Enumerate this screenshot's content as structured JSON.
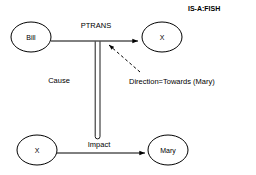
{
  "diagram": {
    "corner_annotation": "IS-A:FISH",
    "nodes": [
      {
        "id": "bill",
        "label": "Bill",
        "cx": 31,
        "cy": 37,
        "rx": 20,
        "ry": 15
      },
      {
        "id": "x_top",
        "label": "X",
        "cx": 162,
        "cy": 37,
        "rx": 20,
        "ry": 15
      },
      {
        "id": "x_bot",
        "label": "X",
        "cx": 37,
        "cy": 150,
        "rx": 20,
        "ry": 15
      },
      {
        "id": "mary",
        "label": "Mary",
        "cx": 168,
        "cy": 150,
        "rx": 20,
        "ry": 15
      }
    ],
    "edges": [
      {
        "id": "ptrans",
        "label": "PTRANS",
        "from": "bill",
        "to": "x_top",
        "style": "solid-arrow"
      },
      {
        "id": "impact",
        "label": "Impact",
        "from": "x_bot",
        "to": "mary",
        "style": "solid-arrow"
      },
      {
        "id": "cause",
        "label": "Cause",
        "from": "impact",
        "to": "ptrans",
        "style": "double-line"
      }
    ],
    "annotations": [
      {
        "id": "direction",
        "text": "Direction=Towards (Mary)",
        "points_to": "ptrans",
        "style": "dashed-arrow"
      }
    ],
    "colors": {
      "stroke": "#000000",
      "background": "#ffffff",
      "text": "#000000"
    }
  }
}
